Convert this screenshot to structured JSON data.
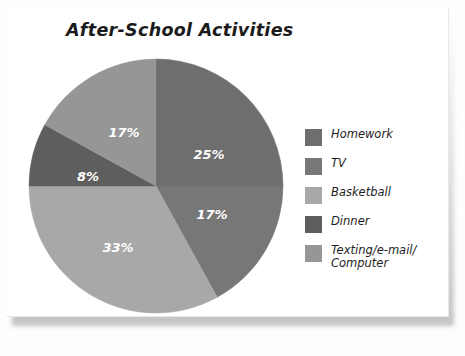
{
  "chart_data": {
    "type": "pie",
    "title": "After-School Activities",
    "categories": [
      "Homework",
      "TV",
      "Basketball",
      "Dinner",
      "Texting/e-mail/\nComputer"
    ],
    "values": [
      25,
      17,
      33,
      8,
      17
    ],
    "value_labels": [
      "25%",
      "17%",
      "33%",
      "8%",
      "17%"
    ],
    "colors": [
      "#6e6e6e",
      "#777777",
      "#a8a8a8",
      "#5e5e5e",
      "#969696"
    ],
    "legend_position": "right",
    "start_angle_deg": 0,
    "direction": "clockwise",
    "units": "percent",
    "grid": false,
    "xlabel": "",
    "ylabel": ""
  },
  "slices": [
    {
      "name": "Homework",
      "label": "25%",
      "value": 25,
      "color": "#6e6e6e",
      "label_x": 181,
      "label_y": 97
    },
    {
      "name": "TV",
      "label": "17%",
      "value": 17,
      "color": "#777777",
      "label_x": 184,
      "label_y": 157
    },
    {
      "name": "Basketball",
      "label": "33%",
      "value": 33,
      "color": "#a8a8a8",
      "label_x": 90,
      "label_y": 190
    },
    {
      "name": "Dinner",
      "label": "8%",
      "value": 8,
      "color": "#5e5e5e",
      "label_x": 60,
      "label_y": 119
    },
    {
      "name": "Texting",
      "label": "17%",
      "value": 17,
      "color": "#969696",
      "label_x": 96,
      "label_y": 75
    }
  ],
  "legend": {
    "items": [
      {
        "label": "Homework",
        "color": "#6e6e6e"
      },
      {
        "label": "TV",
        "color": "#777777"
      },
      {
        "label": "Basketball",
        "color": "#a8a8a8"
      },
      {
        "label": "Dinner",
        "color": "#5e5e5e"
      },
      {
        "label": "Texting/e-mail/\nComputer",
        "color": "#969696"
      }
    ]
  },
  "pie_geometry": {
    "cx": 128,
    "cy": 128,
    "r": 127
  }
}
